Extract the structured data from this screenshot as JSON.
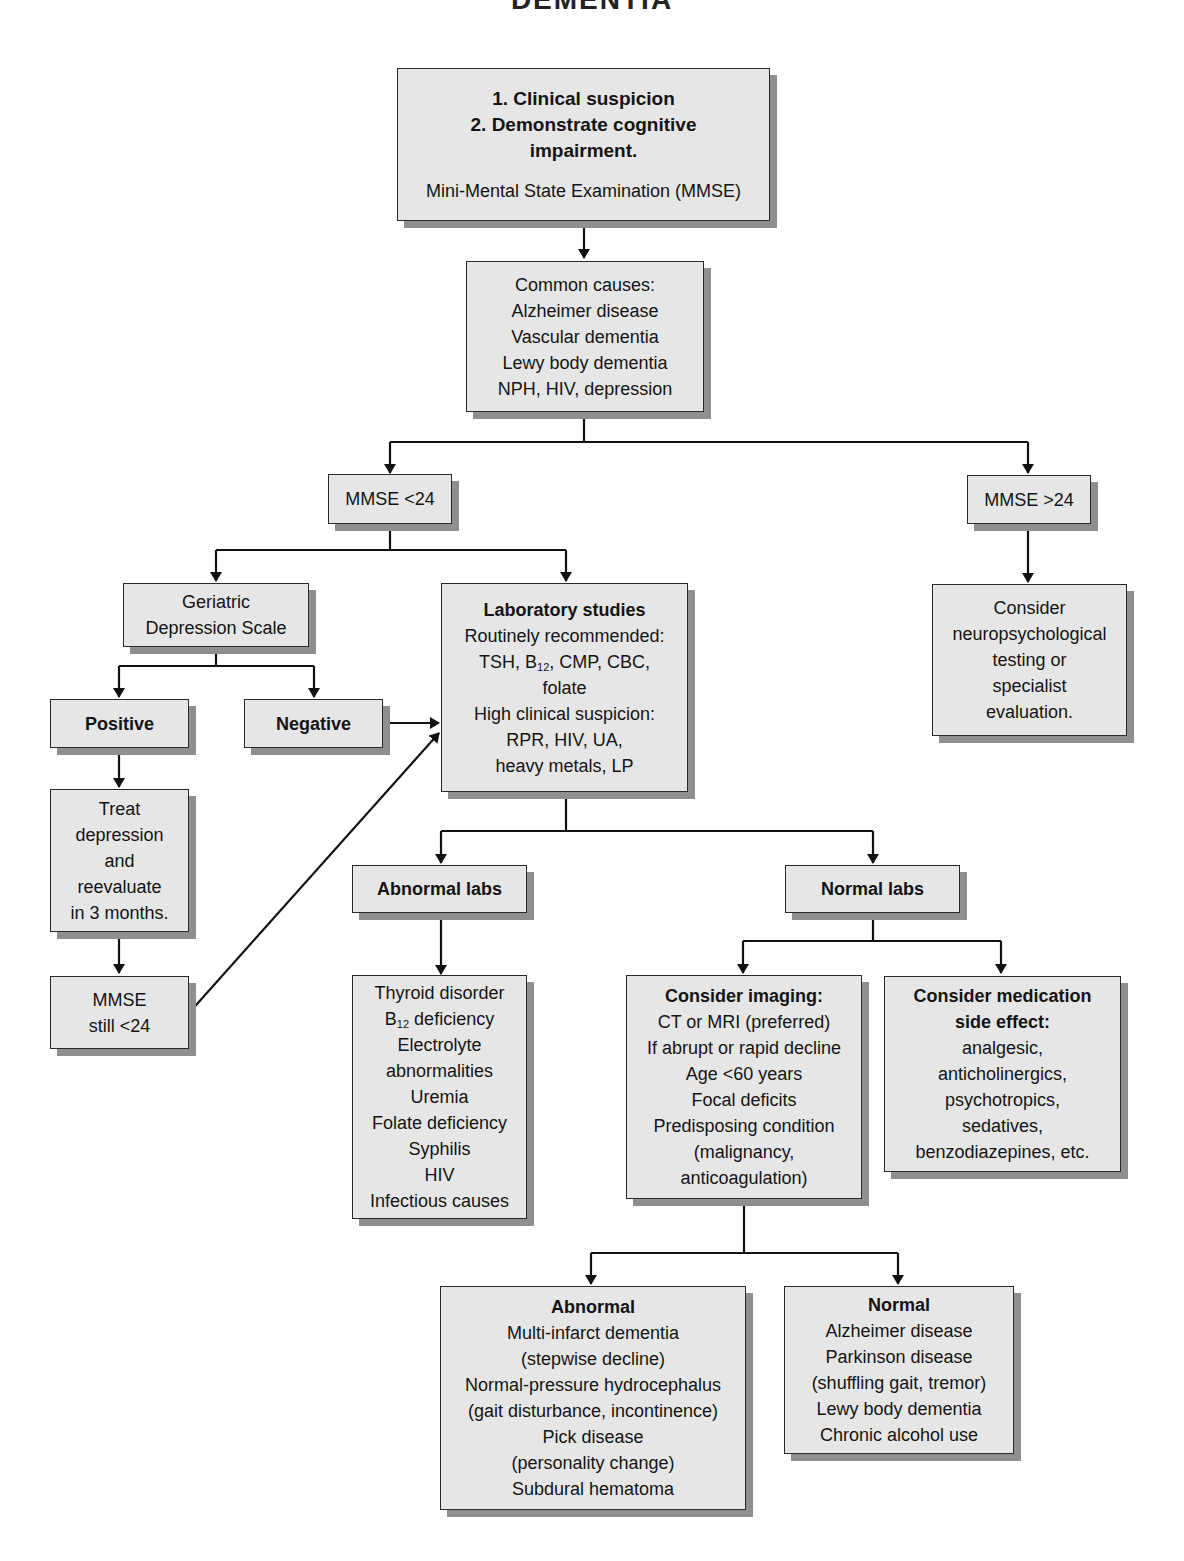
{
  "title": "DEMENTIA",
  "nodes": {
    "start": {
      "bold_lines": [
        "1. Clinical suspicion",
        "2. Demonstrate cognitive",
        "impairment."
      ],
      "lines": [
        "Mini-Mental State Examination (MMSE)"
      ]
    },
    "common_causes": {
      "lines": [
        "Common causes:",
        "Alzheimer disease",
        "Vascular dementia",
        "Lewy body dementia",
        "NPH, HIV, depression"
      ]
    },
    "mmse_low": {
      "label": "MMSE <24"
    },
    "mmse_high": {
      "label": "MMSE >24"
    },
    "neuropsych": {
      "lines": [
        "Consider",
        "neuropsychological",
        "testing or",
        "specialist",
        "evaluation."
      ]
    },
    "gds": {
      "lines": [
        "Geriatric",
        "Depression Scale"
      ]
    },
    "positive": {
      "label": "Positive"
    },
    "negative": {
      "label": "Negative"
    },
    "treat": {
      "lines": [
        "Treat",
        "depression",
        "and",
        "reevaluate",
        "in 3 months."
      ]
    },
    "mmse_still": {
      "lines": [
        "MMSE",
        "still <24"
      ]
    },
    "labs": {
      "heading": "Laboratory studies",
      "routine_label": "Routinely recommended:",
      "routine_line1_pre": "TSH, B",
      "routine_line1_sub": "12",
      "routine_line1_post": ", CMP, CBC,",
      "routine_line2": "folate",
      "high_label": "High clinical suspicion:",
      "high_lines": [
        "RPR, HIV, UA,",
        "heavy metals, LP"
      ]
    },
    "abnormal_labs": {
      "label": "Abnormal labs"
    },
    "normal_labs": {
      "label": "Normal labs"
    },
    "abnormal_causes": {
      "line1": "Thyroid disorder",
      "b12_pre": "B",
      "b12_sub": "12",
      "b12_post": " deficiency",
      "lines": [
        "Electrolyte",
        "abnormalities",
        "Uremia",
        "Folate deficiency",
        "Syphilis",
        "HIV",
        "Infectious causes"
      ]
    },
    "imaging": {
      "heading": "Consider imaging:",
      "lines": [
        "CT or MRI (preferred)",
        "If abrupt or rapid decline",
        "Age <60 years",
        "Focal deficits",
        "Predisposing condition",
        "(malignancy,",
        "anticoagulation)"
      ]
    },
    "medication": {
      "heading_lines": [
        "Consider medication",
        "side effect:"
      ],
      "lines": [
        "analgesic,",
        "anticholinergics,",
        "psychotropics,",
        "sedatives,",
        "benzodiazepines, etc."
      ]
    },
    "imaging_abnormal": {
      "heading": "Abnormal",
      "lines": [
        "Multi-infarct dementia",
        "(stepwise decline)",
        "Normal-pressure hydrocephalus",
        "(gait disturbance, incontinence)",
        "Pick disease",
        "(personality change)",
        "Subdural hematoma"
      ]
    },
    "imaging_normal": {
      "heading": "Normal",
      "lines": [
        "Alzheimer disease",
        "Parkinson disease",
        "(shuffling gait, tremor)",
        "Lewy body dementia",
        "Chronic alcohol use"
      ]
    }
  },
  "colors": {
    "box_fill": "#e6e6e6",
    "shadow": "#8f8f8f",
    "line": "#111111"
  }
}
